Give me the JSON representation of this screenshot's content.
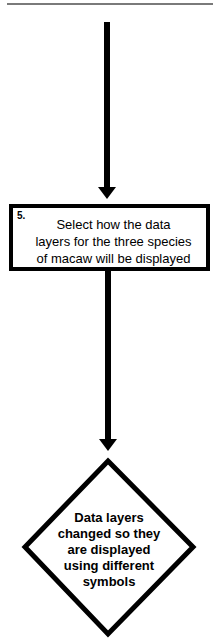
{
  "diagram": {
    "type": "flowchart",
    "colors": {
      "stroke": "#000000",
      "background": "#ffffff",
      "top_rule": "#7a7a7a"
    },
    "nodes": [
      {
        "id": "step5",
        "shape": "rectangle",
        "step_number": "5.",
        "lines": [
          "Select how the data",
          "layers for the three species",
          "of macaw will be displayed"
        ]
      },
      {
        "id": "result",
        "shape": "diamond",
        "lines": [
          "Data layers",
          "changed so they",
          "are displayed",
          "using different",
          "symbols"
        ]
      }
    ],
    "edges": [
      {
        "from": "(above)",
        "to": "step5"
      },
      {
        "from": "step5",
        "to": "result"
      }
    ]
  }
}
